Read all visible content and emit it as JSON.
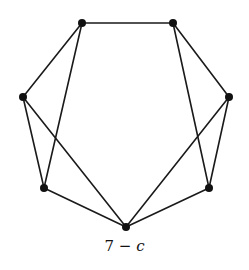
{
  "figure": {
    "caption_number": "7",
    "caption_dash": "−",
    "caption_var": "c",
    "caption_full": "7 − c"
  },
  "graph": {
    "node_color": "#111111",
    "edge_color": "#1a1a1a",
    "nodes": [
      {
        "id": "top-left",
        "x": 82,
        "y": 23
      },
      {
        "id": "top-right",
        "x": 173,
        "y": 23
      },
      {
        "id": "left",
        "x": 23,
        "y": 97
      },
      {
        "id": "right",
        "x": 229,
        "y": 97
      },
      {
        "id": "lower-left",
        "x": 44,
        "y": 188
      },
      {
        "id": "lower-right",
        "x": 209,
        "y": 188
      },
      {
        "id": "bottom",
        "x": 126,
        "y": 227
      }
    ],
    "edges": [
      [
        "top-left",
        "top-right"
      ],
      [
        "top-left",
        "left"
      ],
      [
        "top-left",
        "lower-left"
      ],
      [
        "top-right",
        "right"
      ],
      [
        "top-right",
        "lower-right"
      ],
      [
        "left",
        "lower-left"
      ],
      [
        "left",
        "bottom"
      ],
      [
        "right",
        "lower-right"
      ],
      [
        "right",
        "bottom"
      ],
      [
        "lower-left",
        "bottom"
      ],
      [
        "lower-right",
        "bottom"
      ]
    ]
  }
}
